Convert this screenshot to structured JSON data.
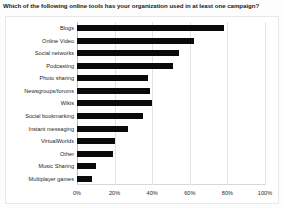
{
  "chart_data": {
    "type": "bar",
    "orientation": "horizontal",
    "title": "Which of the following online tools has your organization used in at least one campaign?",
    "xlabel": "",
    "ylabel": "",
    "xlim": [
      0,
      100
    ],
    "grid": true,
    "legend": false,
    "bar_color": "#0a0a0a",
    "xticks": [
      "0%",
      "20%",
      "40%",
      "60%",
      "80%",
      "100%"
    ],
    "xtick_values": [
      0,
      20,
      40,
      60,
      80,
      100
    ],
    "categories": [
      "Blogs",
      "Online Video",
      "Social networks",
      "Podcasting",
      "Photo sharing",
      "Newsgroups/forums",
      "Wikis",
      "Social bookmarking",
      "Instant messaging",
      "VirtualWorlds",
      "Other",
      "Music Sharing",
      "Multiplayer games"
    ],
    "values": [
      78,
      62,
      54,
      51,
      38,
      39,
      40,
      35,
      27,
      20,
      19,
      10,
      8
    ]
  }
}
